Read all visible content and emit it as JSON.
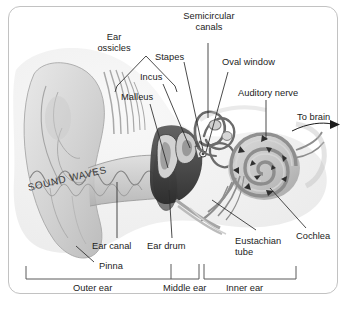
{
  "diagram": {
    "background_color": "#ffffff",
    "border_color": "#c2c2c2",
    "ink_color": "#1c1c1c"
  },
  "labels": {
    "ear_ossicles": "Ear\nossicles",
    "semicircular_canals": "Semicircular\ncanals",
    "stapes": "Stapes",
    "incus": "Incus",
    "malleus": "Malleus",
    "oval_window": "Oval window",
    "auditory_nerve": "Auditory nerve",
    "to_brain": "To brain",
    "cochlea": "Cochlea",
    "eustachian_tube": "Eustachian\ntube",
    "ear_canal": "Ear canal",
    "ear_drum": "Ear drum",
    "pinna": "Pinna",
    "sound_waves": "SOUND WAVES"
  },
  "scale_bar": {
    "segments": [
      {
        "label": "Outer ear"
      },
      {
        "label": "Middle ear"
      },
      {
        "label": "Inner ear"
      }
    ]
  }
}
